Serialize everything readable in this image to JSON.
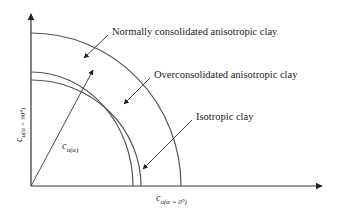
{
  "diagram": {
    "labels": {
      "normally_consolidated": "Normally consolidated anisotropic clay",
      "overconsolidated": "Overconsolidated anisotropic clay",
      "isotropic": "Isotropic clay"
    },
    "axes": {
      "y_label_main": "c",
      "y_label_sub": "u(α = 90°)",
      "x_label_main": "c",
      "x_label_sub": "u(α = 0°)"
    },
    "radius_label_main": "c",
    "radius_label_sub": "u(α)",
    "colors": {
      "curve": "#555555",
      "axis": "#333333",
      "text": "#222222"
    }
  }
}
